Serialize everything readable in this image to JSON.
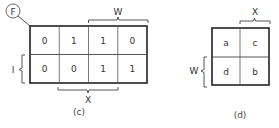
{
  "figure_c": {
    "caption": "(c)",
    "function_label": "F",
    "top_brace_label": "W",
    "left_brace_label": "I",
    "bottom_brace_label": "X",
    "rows": [
      [
        "0",
        "1",
        "1",
        "0"
      ],
      [
        "0",
        "0",
        "1",
        "1"
      ]
    ]
  },
  "figure_d": {
    "caption": "(d)",
    "top_brace_label": "X",
    "left_brace_label": "W",
    "rows": [
      [
        "a",
        "c"
      ],
      [
        "d",
        "b"
      ]
    ]
  }
}
